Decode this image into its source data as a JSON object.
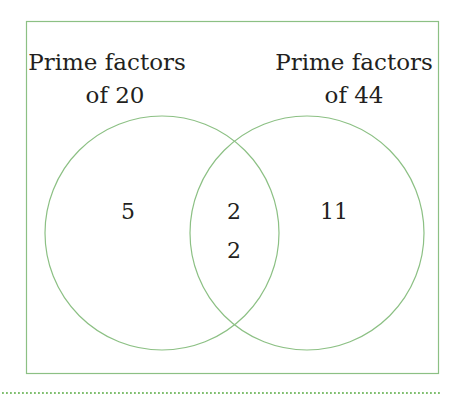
{
  "diagram": {
    "type": "venn",
    "colors": {
      "line": "#8cc084",
      "text": "#231f20",
      "dots": "#7fbf6f"
    },
    "sets": [
      {
        "label_line1": "Prime factors",
        "label_line2": "of 20",
        "only": [
          "5"
        ]
      },
      {
        "label_line1": "Prime factors",
        "label_line2": "of 44",
        "only": [
          "11"
        ]
      }
    ],
    "intersection": [
      "2",
      "2"
    ]
  }
}
